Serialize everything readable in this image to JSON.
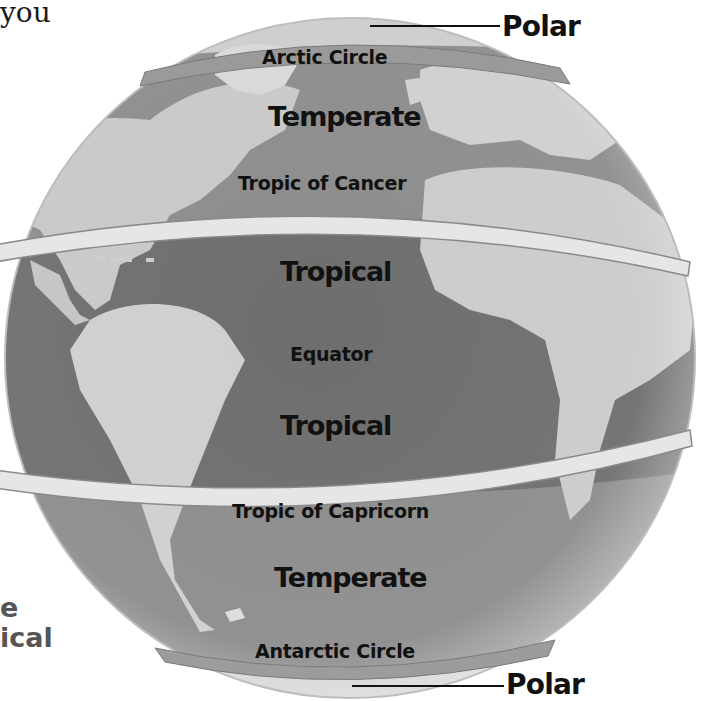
{
  "figure": {
    "colors": {
      "ocean": "#8a8a8a",
      "ocean_tropical": "#6f6f6f",
      "land": "#cfcfcf",
      "band": "#e8e8e8",
      "text": "#111111"
    }
  },
  "fragments": {
    "top_left_text": "you",
    "bottom_left_line1": "e",
    "bottom_left_line2": "ical"
  },
  "latitude_lines": {
    "arctic_circle": "Arctic Circle",
    "tropic_of_cancer": "Tropic of Cancer",
    "equator": "Equator",
    "tropic_of_capricorn": "Tropic of Capricorn",
    "antarctic_circle": "Antarctic Circle"
  },
  "zones": {
    "north_polar": "Polar",
    "north_temperate": "Temperate",
    "north_tropical": "Tropical",
    "south_tropical": "Tropical",
    "south_temperate": "Temperate",
    "south_polar": "Polar"
  }
}
